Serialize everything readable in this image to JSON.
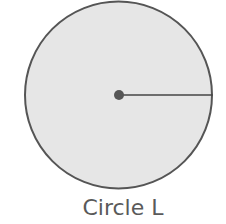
{
  "figure": {
    "label": "Circle L",
    "circle": {
      "cx": 118.5,
      "cy": 95,
      "r": 94,
      "fill": "#e6e6e6",
      "stroke": "#555555"
    },
    "center_point": {
      "r": 5,
      "fill": "#555555"
    },
    "radius_segment": {
      "x2": 212.5,
      "y2": 95,
      "stroke": "#444444"
    }
  }
}
